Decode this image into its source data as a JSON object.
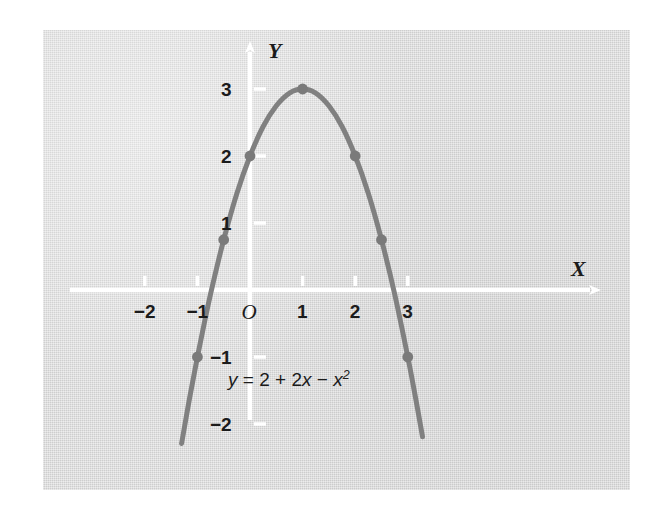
{
  "figure": {
    "background_color": "#ffffff",
    "panel_color": "#d8d8d8",
    "axis_color": "#ffffff",
    "curve_color": "#808080",
    "marker_color": "#7a7a7a",
    "text_color": "#1b1b1b"
  },
  "chart_data": {
    "type": "line",
    "title": "",
    "subtitle": "",
    "xlabel": "X",
    "ylabel": "Y",
    "equation": "y = 2 + 2x - x^2",
    "equation_parts": {
      "lhs": "y",
      "equals": "=",
      "term_constant": "2",
      "plus": "+",
      "term_linear": "2x",
      "minus": "−",
      "term_quadratic_base": "x",
      "term_quadratic_exponent": "2"
    },
    "xlim": [
      -2.9,
      5.2
    ],
    "ylim": [
      -2.5,
      3.9
    ],
    "grid": false,
    "legend": null,
    "x_tick_labels": [
      "-2",
      "-1",
      "O",
      "1",
      "2",
      "3"
    ],
    "x_tick_values": [
      -2,
      -1,
      0,
      1,
      2,
      3
    ],
    "y_tick_labels": [
      "3",
      "2",
      "1",
      "-1",
      "-2"
    ],
    "y_tick_values": [
      3,
      2,
      1,
      -1,
      -2
    ],
    "origin_label": "O",
    "series": [
      {
        "name": "y = 2 + 2x - x^2",
        "marker_points": [
          {
            "x": -1,
            "y": -1
          },
          {
            "x": -0.5,
            "y": 0.75
          },
          {
            "x": 0,
            "y": 2
          },
          {
            "x": 1,
            "y": 3
          },
          {
            "x": 2,
            "y": 2
          },
          {
            "x": 2.5,
            "y": 0.75
          },
          {
            "x": 3,
            "y": -1
          }
        ],
        "curve_x_range": [
          -1.3,
          3.28
        ],
        "curve_samples": [
          {
            "x": -1.3,
            "y": -2.29
          },
          {
            "x": -1.15,
            "y": -1.62
          },
          {
            "x": -1.0,
            "y": -1.0
          },
          {
            "x": -0.85,
            "y": -0.42
          },
          {
            "x": -0.7,
            "y": 0.11
          },
          {
            "x": -0.5,
            "y": 0.75
          },
          {
            "x": -0.25,
            "y": 1.44
          },
          {
            "x": 0.0,
            "y": 2.0
          },
          {
            "x": 0.25,
            "y": 2.44
          },
          {
            "x": 0.5,
            "y": 2.75
          },
          {
            "x": 0.75,
            "y": 2.94
          },
          {
            "x": 1.0,
            "y": 3.0
          },
          {
            "x": 1.25,
            "y": 2.94
          },
          {
            "x": 1.5,
            "y": 2.75
          },
          {
            "x": 1.75,
            "y": 2.44
          },
          {
            "x": 2.0,
            "y": 2.0
          },
          {
            "x": 2.25,
            "y": 1.44
          },
          {
            "x": 2.5,
            "y": 0.75
          },
          {
            "x": 2.75,
            "y": -0.06
          },
          {
            "x": 3.0,
            "y": -1.0
          },
          {
            "x": 3.15,
            "y": -1.62
          },
          {
            "x": 3.28,
            "y": -2.19
          }
        ]
      }
    ]
  },
  "axis_arrows": {
    "x_arrow": "arrow-right",
    "y_arrow": "arrow-up"
  }
}
